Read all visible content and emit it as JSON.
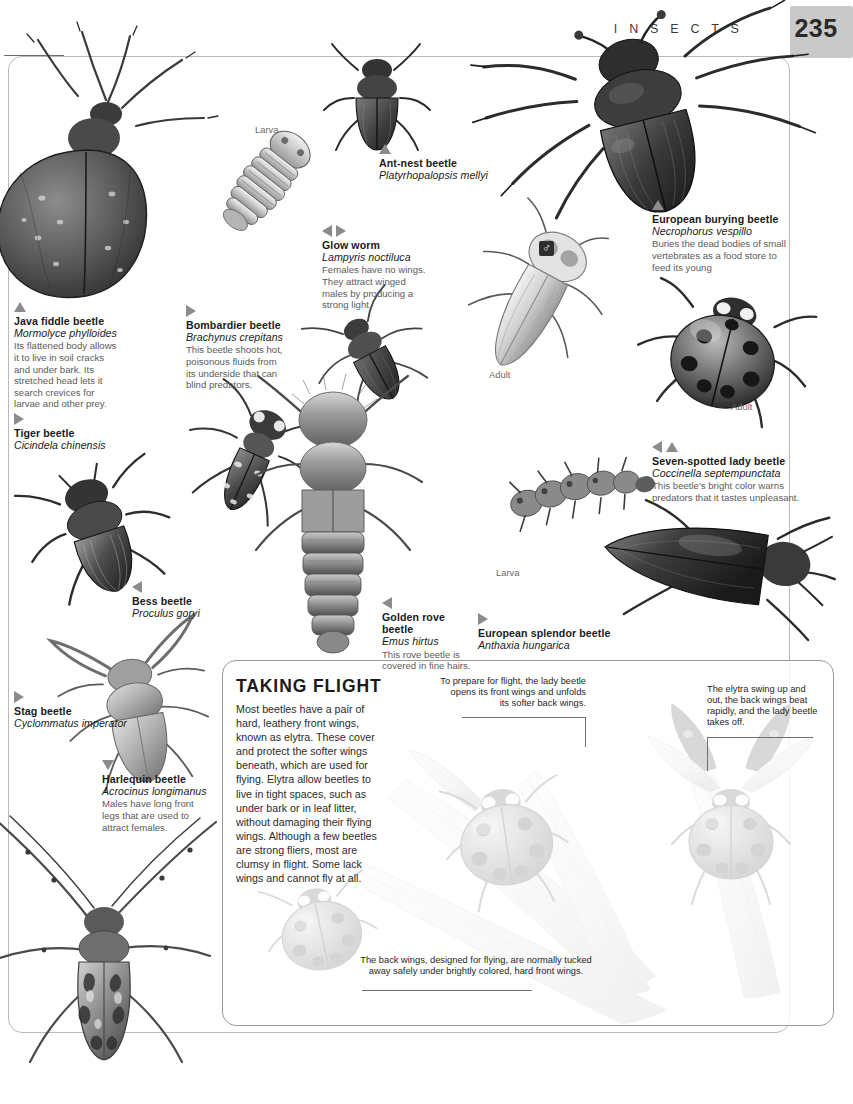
{
  "header": {
    "section_title": "I N S E C T S",
    "page_number": "235"
  },
  "stage_labels": {
    "glowworm_larva": "Larva",
    "glowworm_adult": "Adult",
    "ladybeetle_adult": "Adult",
    "ladybeetle_larva": "Larva"
  },
  "symbols": {
    "male": "♂"
  },
  "specimens": [
    {
      "id": "java-fiddle-beetle",
      "marker": "up",
      "name": "Java fiddle beetle",
      "scientific": "Mormolyce phylloides",
      "description": "Its flattened body allows it to live in soil cracks and under bark. Its stretched head lets it search crevices for larvae and other prey."
    },
    {
      "id": "ant-nest-beetle",
      "marker": "up",
      "name": "Ant-nest beetle",
      "scientific": "Platyrhopalopsis mellyi",
      "description": ""
    },
    {
      "id": "glow-worm",
      "marker": "left-right",
      "name": "Glow worm",
      "scientific": "Lampyris noctiluca",
      "description": "Females have no wings. They attract winged males by producing a strong light."
    },
    {
      "id": "european-burying-beetle",
      "marker": "up",
      "name": "European burying beetle",
      "scientific": "Necrophorus vespillo",
      "description": "Buries the dead bodies of small vertebrates as a food store to feed its young"
    },
    {
      "id": "bombardier-beetle",
      "marker": "right",
      "name": "Bombardier beetle",
      "scientific": "Brachynus crepitans",
      "description": "This beetle shoots hot, poisonous fluids from its underside that can blind predators."
    },
    {
      "id": "tiger-beetle",
      "marker": "right",
      "name": "Tiger beetle",
      "scientific": "Cicindela chinensis",
      "description": ""
    },
    {
      "id": "seven-spotted-lady-beetle",
      "marker": "left-up",
      "name": "Seven-spotted lady beetle",
      "scientific": "Coccinella septempunctata",
      "description": "This beetle's bright color warns predators that it tastes unpleasant."
    },
    {
      "id": "bess-beetle",
      "marker": "left",
      "name": "Bess beetle",
      "scientific": "Proculus goryi",
      "description": ""
    },
    {
      "id": "golden-rove-beetle",
      "marker": "left",
      "name": "Golden rove beetle",
      "scientific": "Emus hirtus",
      "description": "This rove beetle is covered in fine hairs."
    },
    {
      "id": "european-splendor-beetle",
      "marker": "right",
      "name": "European splendor beetle",
      "scientific": "Anthaxia hungarica",
      "description": ""
    },
    {
      "id": "stag-beetle",
      "marker": "right",
      "name": "Stag beetle",
      "scientific": "Cyclommatus imperator",
      "description": ""
    },
    {
      "id": "harlequin-beetle",
      "marker": "down",
      "name": "Harlequin beetle",
      "scientific": "Acrocinus longimanus",
      "description": "Males have long front legs that are used to attract females."
    }
  ],
  "flight_panel": {
    "title": "TAKING FLIGHT",
    "body": "Most beetles have a pair of hard, leathery front wings, known as elytra. These cover and protect the softer wings beneath, which are used for flying. Elytra allow beetles to live in tight spaces, such as under bark or in leaf litter, without damaging their flying wings. Although a few beetles are strong fliers, most are clumsy in flight. Some lack wings and cannot fly at all.",
    "callouts": [
      {
        "id": "prepare-for-flight",
        "text": "To prepare for flight, the lady beetle opens its front wings and unfolds its softer back wings."
      },
      {
        "id": "elytra-swing-up",
        "text": "The elytra swing up and out, the back wings beat rapidly, and the lady beetle takes off."
      },
      {
        "id": "back-wings-tucked",
        "text": "The back wings, designed for flying, are normally tucked away safely under brightly colored, hard front wings."
      }
    ]
  },
  "colors": {
    "page_number_box": "#c9c9c9",
    "marker_gray": "#8c8c8c",
    "frame_border": "#b9b9b9",
    "body_text": "#2b2b2b",
    "description_text": "#5b5b5b"
  }
}
